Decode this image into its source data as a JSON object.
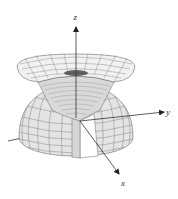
{
  "figure": {
    "type": "3d-surface-diagram",
    "axes": {
      "z_label": "z",
      "y_label": "y",
      "x_label": "x"
    },
    "surfaces": [
      {
        "name": "upper-funnel-surface",
        "style": "wireframe mesh"
      },
      {
        "name": "lower-hemisphere-with-wedge-cut",
        "style": "shaded mesh"
      }
    ],
    "colors": {
      "mesh_line": "#6b6b6b",
      "surface_fill": "#e4e4e4",
      "inner_fill": "#cfcfcf",
      "axis": "#333333",
      "background": "#ffffff"
    }
  }
}
